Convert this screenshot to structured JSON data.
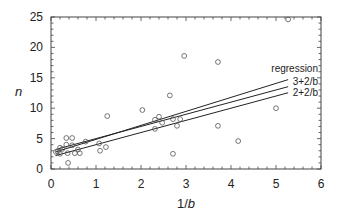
{
  "chart_data": {
    "type": "scatter",
    "title": "",
    "xlabel": "1/b",
    "ylabel": "n",
    "xlim": [
      0,
      6
    ],
    "ylim": [
      0,
      25
    ],
    "xticks": [
      0,
      1,
      2,
      3,
      4,
      5,
      6
    ],
    "yticks": [
      0,
      5,
      10,
      15,
      20,
      25
    ],
    "grid": false,
    "legend_position": "inline-right",
    "points": [
      [
        0.11,
        2.8
      ],
      [
        0.15,
        2.9
      ],
      [
        0.2,
        3.5
      ],
      [
        0.34,
        5.1
      ],
      [
        0.47,
        5.1
      ],
      [
        0.34,
        4.0
      ],
      [
        0.37,
        2.6
      ],
      [
        0.38,
        1.0
      ],
      [
        0.47,
        3.9
      ],
      [
        0.53,
        2.6
      ],
      [
        0.64,
        2.6
      ],
      [
        0.77,
        4.5
      ],
      [
        0.2,
        2.5
      ],
      [
        0.25,
        3.3
      ],
      [
        0.6,
        3.2
      ],
      [
        1.07,
        4.2
      ],
      [
        1.09,
        3.0
      ],
      [
        1.22,
        3.6
      ],
      [
        1.25,
        8.7
      ],
      [
        2.03,
        9.7
      ],
      [
        2.31,
        8.1
      ],
      [
        2.4,
        8.6
      ],
      [
        2.47,
        7.6
      ],
      [
        2.31,
        6.6
      ],
      [
        2.64,
        12.1
      ],
      [
        2.71,
        8.2
      ],
      [
        2.71,
        2.5
      ],
      [
        2.8,
        7.1
      ],
      [
        2.87,
        8.2
      ],
      [
        2.96,
        18.6
      ],
      [
        3.71,
        17.6
      ],
      [
        3.71,
        7.1
      ],
      [
        4.16,
        4.6
      ],
      [
        5.0,
        10.0
      ],
      [
        5.27,
        24.6
      ]
    ],
    "series": [
      {
        "name": "regression",
        "x": [
          0.1,
          5.27
        ],
        "y": [
          2.8,
          14.7
        ]
      },
      {
        "name": "3+2/b",
        "x": [
          0.1,
          5.27
        ],
        "y": [
          3.2,
          13.54
        ]
      },
      {
        "name": "2+2/b",
        "x": [
          0.1,
          5.27
        ],
        "y": [
          2.2,
          12.54
        ]
      }
    ]
  }
}
